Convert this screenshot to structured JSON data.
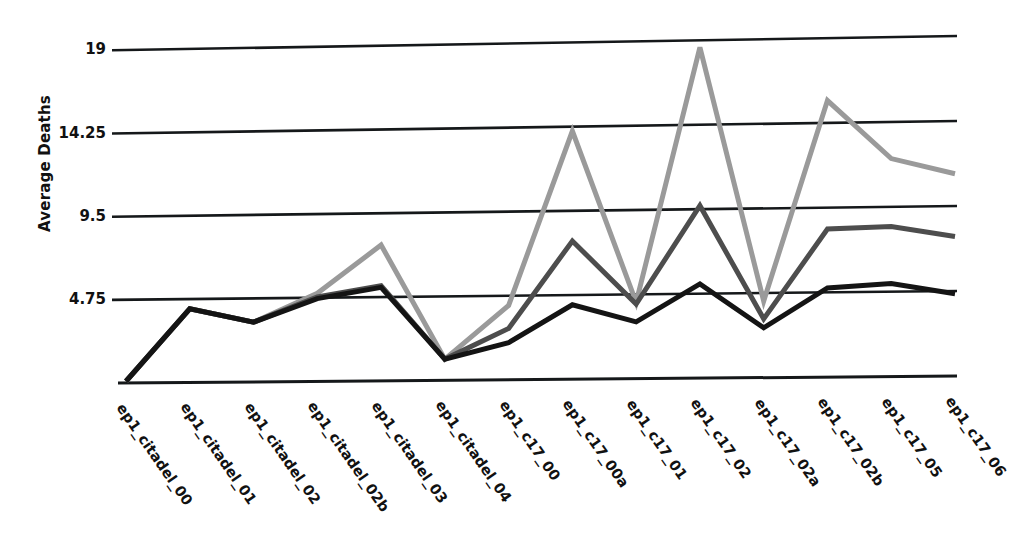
{
  "chart_data": {
    "type": "line",
    "title": "",
    "xlabel": "",
    "ylabel": "Average Deaths",
    "ylim": [
      0,
      19
    ],
    "yticks": [
      4.75,
      9.5,
      14.25,
      19
    ],
    "ytick_labels": [
      "4.75",
      "9.5",
      "14.25",
      "19"
    ],
    "grid": true,
    "legend": "none",
    "categories": [
      "ep1_citadel_00",
      "ep1_citadel_01",
      "ep1_citadel_02",
      "ep1_citadel_02b",
      "ep1_citadel_03",
      "ep1_citadel_04",
      "ep1_c17_00",
      "ep1_c17_00a",
      "ep1_c17_01",
      "ep1_c17_02",
      "ep1_c17_02a",
      "ep1_c17_02b",
      "ep1_c17_05",
      "ep1_c17_06"
    ],
    "series": [
      {
        "name": "series-light",
        "color": "#9a9a9a",
        "values": [
          0.1,
          4.2,
          3.4,
          5.0,
          7.7,
          1.2,
          4.2,
          14.0,
          4.3,
          18.6,
          4.3,
          15.5,
          12.2,
          11.3
        ]
      },
      {
        "name": "series-medium",
        "color": "#4d4d4d",
        "values": [
          0.1,
          4.2,
          3.4,
          4.8,
          5.4,
          1.2,
          2.9,
          7.8,
          4.2,
          9.7,
          3.3,
          8.3,
          8.4,
          7.8
        ]
      },
      {
        "name": "series-dark",
        "color": "#141414",
        "values": [
          0.1,
          4.2,
          3.4,
          4.7,
          5.3,
          1.2,
          2.1,
          4.2,
          3.2,
          5.3,
          2.8,
          5.0,
          5.2,
          4.6
        ]
      }
    ]
  },
  "axis": {
    "y_title": "Average Deaths"
  }
}
